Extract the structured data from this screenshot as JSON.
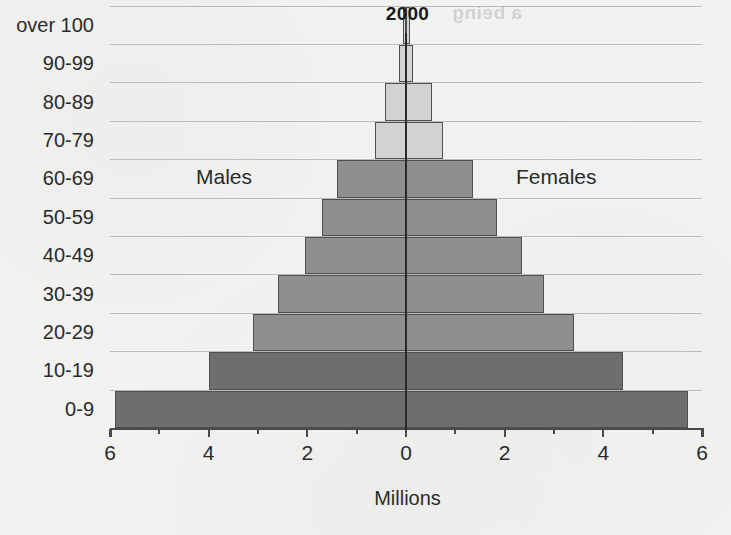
{
  "title": "2000",
  "artifact_text": "a being",
  "axis": {
    "x_title": "Millions",
    "x_ticks": [
      {
        "label": "6",
        "value": -6
      },
      {
        "label": "4",
        "value": -4
      },
      {
        "label": "2",
        "value": -2
      },
      {
        "label": "0",
        "value": 0
      },
      {
        "label": "2",
        "value": 2
      },
      {
        "label": "4",
        "value": 4
      },
      {
        "label": "6",
        "value": 6
      }
    ],
    "x_min": -6,
    "x_max": 6
  },
  "series_labels": {
    "left": "Males",
    "right": "Females"
  },
  "colors": {
    "background": "#f2f2f0",
    "bar_light": "#d2d2d2",
    "bar_mid": "#8f8f8f",
    "bar_dark": "#6e6e6e",
    "bar_border": "#4f4f52",
    "gridline": "#a9a9ad",
    "axis": "#4a4a4a",
    "text": "#2b2b2b"
  },
  "chart_data": {
    "type": "bar",
    "title": "2000",
    "xlabel": "Millions",
    "ylabel": "",
    "xlim": [
      -6,
      6
    ],
    "grid": true,
    "legend": "inline",
    "orientation": "horizontal-diverging",
    "categories": [
      "0-9",
      "10-19",
      "20-29",
      "30-39",
      "40-49",
      "50-59",
      "60-69",
      "70-79",
      "80-89",
      "90-99",
      "over 100"
    ],
    "series": [
      {
        "name": "Males",
        "side": "left",
        "values": [
          5.9,
          4.0,
          3.1,
          2.6,
          2.05,
          1.7,
          1.4,
          0.63,
          0.42,
          0.15,
          0.06
        ]
      },
      {
        "name": "Females",
        "side": "right",
        "values": [
          5.72,
          4.4,
          3.4,
          2.8,
          2.35,
          1.85,
          1.36,
          0.75,
          0.52,
          0.15,
          0.08
        ]
      }
    ],
    "bar_shades": [
      "bar_dark",
      "bar_dark",
      "bar_mid",
      "bar_mid",
      "bar_mid",
      "bar_mid",
      "bar_mid",
      "bar_light",
      "bar_light",
      "bar_light",
      "bar_light"
    ]
  }
}
